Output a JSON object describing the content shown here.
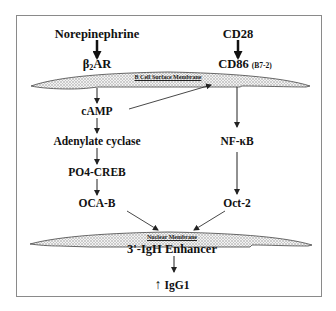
{
  "diagram": {
    "colors": {
      "border": "#8a8a8a",
      "membrane_fill": "#e4e4e4",
      "stroke": "#222222",
      "text": "#111111"
    },
    "left_pathway": {
      "ligand": "Norepinephrine",
      "receptor_main": "β",
      "receptor_sub": "2",
      "receptor_rest": "AR",
      "steps": [
        "cAMP",
        "Adenylate cyclase",
        "PO4-CREB",
        "OCA-B"
      ]
    },
    "right_pathway": {
      "ligand": "CD28",
      "receptor": "CD86",
      "receptor_alias": "(B7-2)",
      "steps": [
        "NF-κB",
        "Oct-2"
      ]
    },
    "membranes": {
      "surface": "B Cell Surface Membrane",
      "nuclear": "Nuclear Membrane"
    },
    "target": "3'-IgH Enhancer",
    "outcome": {
      "arrow": "↑",
      "label": "IgG1"
    },
    "edges": [
      [
        "Norepinephrine",
        "β2AR"
      ],
      [
        "CD28",
        "CD86 (B7-2)"
      ],
      [
        "β2AR",
        "cAMP"
      ],
      [
        "cAMP",
        "CD86 (B7-2)"
      ],
      [
        "cAMP",
        "Adenylate cyclase"
      ],
      [
        "Adenylate cyclase",
        "PO4-CREB"
      ],
      [
        "PO4-CREB",
        "OCA-B"
      ],
      [
        "CD86 (B7-2)",
        "NF-κB"
      ],
      [
        "NF-κB",
        "Oct-2"
      ],
      [
        "OCA-B",
        "3'-IgH Enhancer"
      ],
      [
        "Oct-2",
        "3'-IgH Enhancer"
      ],
      [
        "3'-IgH Enhancer",
        "IgG1"
      ]
    ]
  }
}
